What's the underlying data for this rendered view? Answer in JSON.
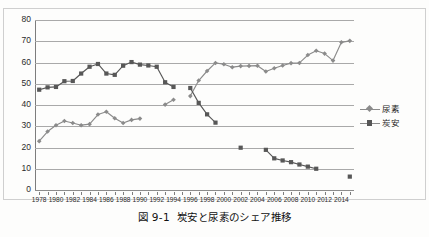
{
  "caption": {
    "number": "図 9-1",
    "text": "炭安と尿素のシェア推移"
  },
  "legend": {
    "position": "right-middle",
    "items": [
      {
        "label": "尿素",
        "marker": "diamond-icon",
        "color": "#8b8b8b"
      },
      {
        "label": "炭安",
        "marker": "square-icon",
        "color": "#575757"
      }
    ]
  },
  "axes": {
    "y_ticks": [
      "80",
      "70",
      "60",
      "50",
      "40",
      "30",
      "20",
      "10",
      "0"
    ],
    "x_ticks": [
      "1978",
      "1980",
      "1982",
      "1984",
      "1986",
      "1988",
      "1990",
      "1992",
      "1994",
      "1996",
      "1998",
      "2000",
      "2002",
      "2004",
      "2006",
      "2008",
      "2010",
      "2012",
      "2014"
    ]
  },
  "chart_data": {
    "type": "line",
    "title": "炭安と尿素のシェア推移",
    "xlabel": "",
    "ylabel": "",
    "xlim": [
      1977.5,
      2015.5
    ],
    "ylim": [
      0,
      80
    ],
    "grid": true,
    "legend_position": "right",
    "x": [
      1978,
      1979,
      1980,
      1981,
      1982,
      1983,
      1984,
      1985,
      1986,
      1987,
      1988,
      1989,
      1990,
      1991,
      1992,
      1993,
      1994,
      1995,
      1996,
      1997,
      1998,
      1999,
      2000,
      2001,
      2002,
      2003,
      2004,
      2005,
      2006,
      2007,
      2008,
      2009,
      2010,
      2011,
      2012,
      2013,
      2014,
      2015
    ],
    "series": [
      {
        "name": "尿素",
        "marker": "diamond",
        "color": "#8b8b8b",
        "values": [
          23.0,
          27.5,
          30.5,
          32.5,
          31.5,
          30.5,
          31.0,
          35.5,
          36.8,
          33.8,
          31.5,
          33.0,
          33.6,
          null,
          null,
          40.2,
          42.5,
          null,
          44.2,
          51.5,
          56.0,
          59.8,
          59.2,
          57.8,
          58.3,
          58.4,
          58.5,
          55.8,
          57.3,
          58.6,
          59.7,
          59.8,
          63.5,
          65.5,
          64.2,
          60.9,
          69.5,
          70.2
        ]
      },
      {
        "name": "炭安",
        "marker": "square",
        "color": "#575757",
        "values": [
          47.2,
          48.3,
          48.5,
          51.2,
          51.3,
          54.8,
          58.0,
          59.3,
          54.8,
          54.2,
          58.5,
          60.2,
          59.0,
          58.6,
          58.0,
          50.7,
          48.5,
          null,
          48.0,
          41.0,
          35.6,
          31.7,
          null,
          null,
          19.9,
          null,
          null,
          18.9,
          14.9,
          13.9,
          13.1,
          12.0,
          11.0,
          10.0,
          null,
          null,
          null,
          6.3
        ]
      }
    ]
  }
}
